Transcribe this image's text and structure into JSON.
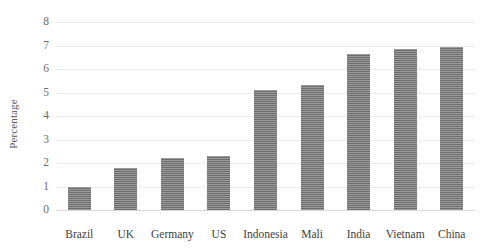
{
  "chart_data": {
    "type": "bar",
    "title": "",
    "xlabel": "",
    "ylabel": "Percentage",
    "ylim": [
      0,
      8
    ],
    "yticks": [
      0,
      1,
      2,
      3,
      4,
      5,
      6,
      7,
      8
    ],
    "grid": true,
    "legend": "none",
    "categories": [
      "Brazil",
      "UK",
      "Germany",
      "US",
      "Indonesia",
      "Mali",
      "India",
      "Vietnam",
      "China"
    ],
    "values": [
      1.0,
      1.8,
      2.2,
      2.3,
      5.1,
      5.3,
      6.65,
      6.85,
      6.95
    ],
    "series": [
      {
        "name": "Percentage",
        "values": [
          1.0,
          1.8,
          2.2,
          2.3,
          5.1,
          5.3,
          6.65,
          6.85,
          6.95
        ],
        "color": "#6e6e6e"
      }
    ],
    "bar_fill_pattern": "horizontal-hatch",
    "bar_color": "#6e6e6e",
    "gridline_color": "#eceaea",
    "axis_text_color": "#3d3d3d",
    "tick_text_color": "#6b6b6b",
    "background": "#ffffff"
  }
}
